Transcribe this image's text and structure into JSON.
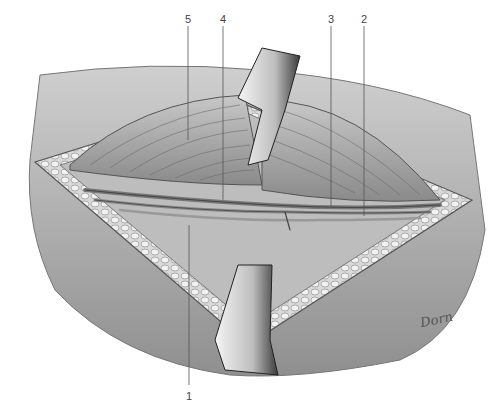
{
  "figure": {
    "type": "anatomical-surgical-illustration",
    "labels": [
      {
        "id": "5",
        "text": "5",
        "x": 188,
        "y": 14
      },
      {
        "id": "4",
        "text": "4",
        "x": 223,
        "y": 14
      },
      {
        "id": "3",
        "text": "3",
        "x": 331,
        "y": 14
      },
      {
        "id": "2",
        "text": "2",
        "x": 364,
        "y": 14
      },
      {
        "id": "1",
        "text": "1",
        "x": 189,
        "y": 396
      }
    ],
    "signature": "Dorn"
  }
}
